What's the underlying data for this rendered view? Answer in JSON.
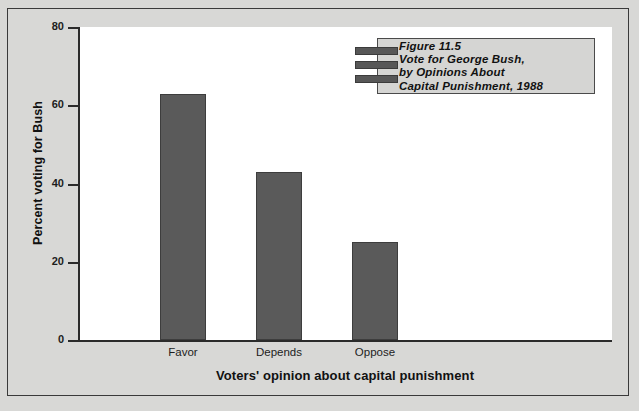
{
  "chart_data": {
    "type": "bar",
    "title": "Figure 11.5 Vote for George Bush, by Opinions About Capital Punishment, 1988",
    "categories": [
      "Favor",
      "Depends",
      "Oppose"
    ],
    "values": [
      63,
      43,
      25
    ],
    "xlabel": "Voters' opinion about capital punishment",
    "ylabel": "Percent voting for Bush",
    "ylim": [
      0,
      80
    ],
    "yticks": [
      0,
      20,
      40,
      60,
      80
    ],
    "ytick_labels": [
      "0",
      "20",
      "40",
      "60",
      "80"
    ],
    "grid": false,
    "legend": "none",
    "bar_color": "#5a5a5a",
    "plot_background": "#ffffff",
    "page_background": "#d8d8d6"
  },
  "caption": {
    "lines": [
      "Figure 11.5",
      "Vote for George Bush,",
      "by Opinions About",
      "Capital Punishment, 1988"
    ]
  }
}
